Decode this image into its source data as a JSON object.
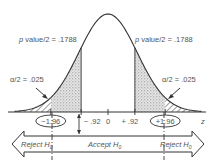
{
  "diagram": {
    "type": "two-tailed normal distribution hypothesis test",
    "curve": {
      "mean": 0,
      "sd": 1,
      "x_range": [
        -3.2,
        3.2
      ]
    },
    "labels": {
      "pvalue_left_prefix": "p",
      "pvalue_left": " value/2  =  .1788",
      "pvalue_right_prefix": "p",
      "pvalue_right": " value/2  =  .1788",
      "alpha_left": "α/2  =  .025",
      "alpha_right": "α/2  =  .025",
      "z_axis": "z"
    },
    "axis_ticks": [
      {
        "value": -1.96,
        "label": "−1.96",
        "circled": true
      },
      {
        "value": -0.92,
        "label": "− .92",
        "circled": false
      },
      {
        "value": 0,
        "label": "0",
        "circled": false
      },
      {
        "value": 0.92,
        "label": "+ .92",
        "circled": false
      },
      {
        "value": 1.96,
        "label": "+1.96",
        "circled": true
      }
    ],
    "test_statistic_abs": 0.92,
    "critical_value_abs": 1.96,
    "p_value_half": 0.1788,
    "alpha_half": 0.025,
    "regions": {
      "reject_left": "Reject H",
      "accept": "Accept H",
      "reject_right": "Reject H",
      "subscript": "0"
    },
    "colors": {
      "ink": "#333333",
      "text": "#555555",
      "stipple": "#9a9a9a"
    }
  }
}
